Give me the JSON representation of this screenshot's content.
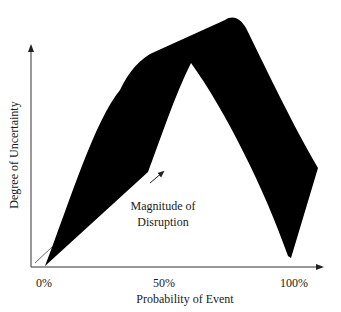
{
  "diagram": {
    "y_axis_label": "Degree of Uncertainty",
    "x_axis_label": "Probability of Event",
    "x_ticks": [
      "0%",
      "50%",
      "100%"
    ],
    "annotation": {
      "line1": "Magnitude of",
      "line2": "Disruption"
    },
    "colors": {
      "shape_fill": "#000000",
      "axis": "#333333",
      "background": "#ffffff"
    }
  }
}
